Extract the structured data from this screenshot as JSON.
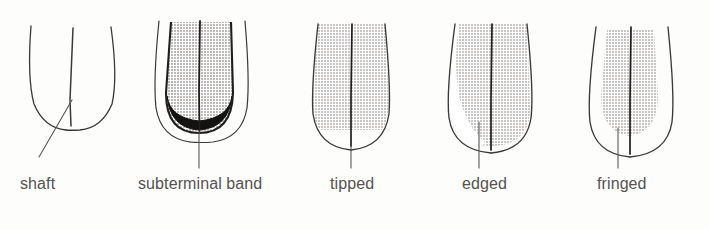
{
  "figure": {
    "background_color": "#fdfdfc",
    "ink_color": "#3c3a39",
    "shade_color": "#c9c7c5",
    "dark_band_color": "#131211",
    "label_color": "#555252"
  },
  "panels": [
    {
      "id": "shaft",
      "label": "shaft",
      "label_x": 20,
      "label_y": 175,
      "pattern": "plain-outline",
      "description": "Unshaded feather outline with central shaft line",
      "shaded": false,
      "has_subterminal_band": false,
      "leader": "diagonal"
    },
    {
      "id": "subterminal-band",
      "label": "subterminal band",
      "label_x": 138,
      "label_y": 175,
      "pattern": "subterminal-band",
      "description": "Shaded vane inset inside outline with dark crescent band above the tip",
      "shaded": true,
      "has_subterminal_band": true,
      "leader": "vertical"
    },
    {
      "id": "tipped",
      "label": "tipped",
      "label_x": 330,
      "label_y": 175,
      "pattern": "tipped",
      "description": "Shading covers vane down to a pale rounded tip",
      "shaded": true,
      "has_subterminal_band": false,
      "leader": "vertical"
    },
    {
      "id": "edged",
      "label": "edged",
      "label_x": 462,
      "label_y": 175,
      "pattern": "edged",
      "description": "Shading on one side of the vane only, pale along the opposite edge",
      "shaded": true,
      "has_subterminal_band": false,
      "leader": "vertical"
    },
    {
      "id": "fringed",
      "label": "fringed",
      "label_x": 597,
      "label_y": 175,
      "pattern": "fringed",
      "description": "Shaded centre with a pale fringe all round the margin",
      "shaded": true,
      "has_subterminal_band": false,
      "leader": "vertical"
    }
  ]
}
